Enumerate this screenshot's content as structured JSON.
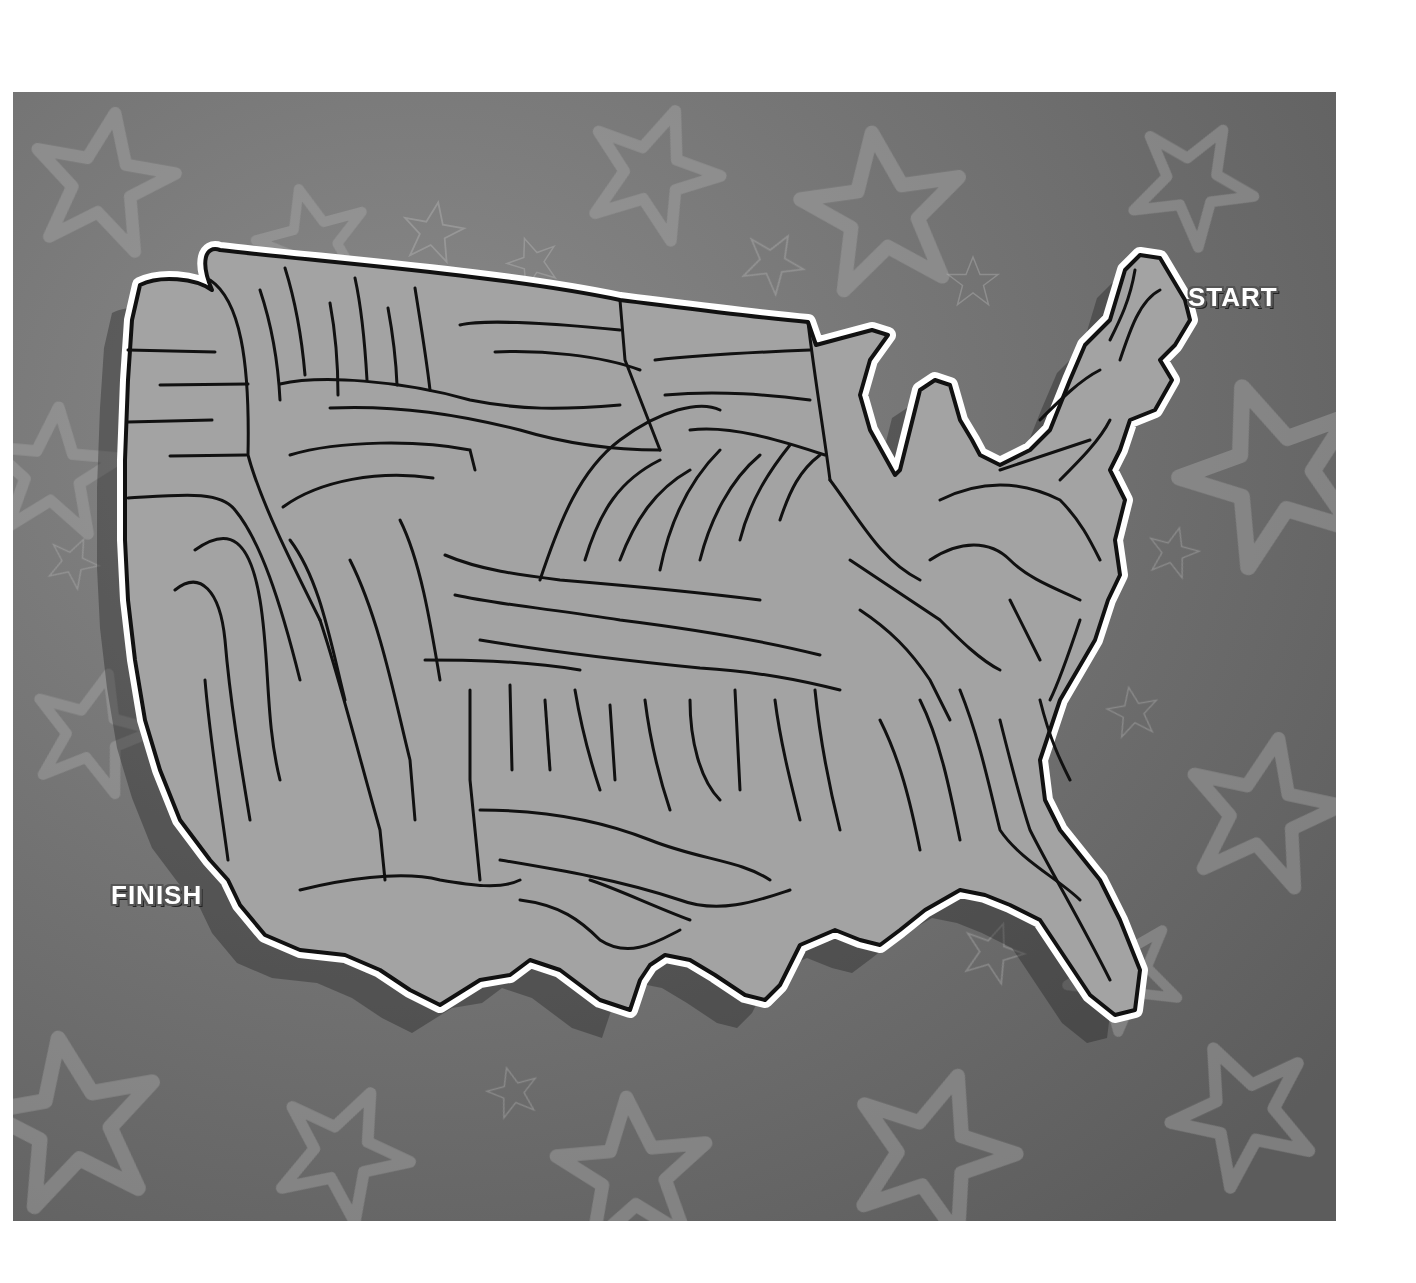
{
  "puzzle": {
    "type": "maze",
    "theme": "United States map",
    "start_label": "START",
    "finish_label": "FINISH"
  },
  "colors": {
    "page_background": "#ffffff",
    "panel_background": "#7a7a7a",
    "star_pattern": "#a8a8a8",
    "map_fill": "#a3a3a3",
    "map_outline_outer": "#ffffff",
    "maze_walls": "#111111",
    "label_text": "#ffffff"
  }
}
